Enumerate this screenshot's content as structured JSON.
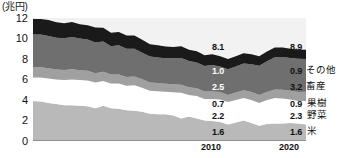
{
  "axis": {
    "unit_label": "(兆円)",
    "y_ticks": [
      "12",
      "10",
      "8",
      "6",
      "4",
      "2",
      "0"
    ],
    "x_labels": [
      "2010",
      "2020"
    ]
  },
  "series_names": {
    "other": "その他",
    "livestock": "畜産",
    "fruit": "果樹",
    "vegetables": "野菜",
    "rice": "米"
  },
  "endpoint_values": {
    "total_2010": "8.1",
    "total_2020": "8.9",
    "other_2010": "1.0",
    "other_2020": "0.9",
    "livestock_2010": "2.5",
    "livestock_2020": "3.2",
    "fruit_2010": "0.7",
    "fruit_2020": "0.9",
    "vegetables_2010": "2.2",
    "vegetables_2020": "2.3",
    "rice_2010": "1.6",
    "rice_2020": "1.6"
  },
  "colors": {
    "other": "#1a1a1a",
    "livestock": "#6f6f6f",
    "fruit": "#a0a0a0",
    "vegetables": "#ffffff",
    "rice": "#b9b9b9",
    "plot_background": "#f2f2f2",
    "axis": "#8d8d8d",
    "text": "#111111"
  },
  "chart_data": {
    "type": "area",
    "title": "",
    "subtitle": "",
    "xlabel": "",
    "ylabel": "(兆円)",
    "ylim": [
      0,
      12
    ],
    "xlim": [
      1985,
      2020
    ],
    "grid": false,
    "stacked": true,
    "legend_position": "right-inline",
    "x": [
      1985,
      1986,
      1987,
      1988,
      1989,
      1990,
      1991,
      1992,
      1993,
      1994,
      1995,
      1996,
      1997,
      1998,
      1999,
      2000,
      2001,
      2002,
      2003,
      2004,
      2005,
      2006,
      2007,
      2008,
      2009,
      2010,
      2011,
      2012,
      2013,
      2014,
      2015,
      2016,
      2017,
      2018,
      2019,
      2020
    ],
    "series": [
      {
        "name": "米",
        "color": "#b9b9b9",
        "values": [
          3.9,
          3.85,
          3.7,
          3.6,
          3.5,
          3.5,
          3.45,
          3.4,
          3.2,
          3.45,
          3.2,
          3.15,
          3.0,
          2.95,
          2.85,
          2.65,
          2.6,
          2.6,
          2.5,
          2.2,
          2.4,
          2.2,
          2.0,
          1.95,
          1.85,
          1.6,
          1.8,
          2.0,
          1.75,
          1.5,
          1.65,
          1.7,
          1.7,
          1.75,
          1.7,
          1.6
        ]
      },
      {
        "name": "野菜",
        "color": "#ffffff",
        "values": [
          2.3,
          2.35,
          2.4,
          2.4,
          2.45,
          2.5,
          2.5,
          2.5,
          2.5,
          2.4,
          2.4,
          2.45,
          2.4,
          2.5,
          2.35,
          2.25,
          2.25,
          2.2,
          2.25,
          2.5,
          2.1,
          2.2,
          2.1,
          2.15,
          2.2,
          2.2,
          2.2,
          2.2,
          2.25,
          2.2,
          2.35,
          2.5,
          2.45,
          2.3,
          2.2,
          2.3
        ]
      },
      {
        "name": "果樹",
        "color": "#a0a0a0",
        "values": [
          1.0,
          1.0,
          1.0,
          0.98,
          0.98,
          1.0,
          0.95,
          0.95,
          0.92,
          0.9,
          0.9,
          0.88,
          0.85,
          0.85,
          0.82,
          0.8,
          0.8,
          0.78,
          0.78,
          0.8,
          0.75,
          0.75,
          0.72,
          0.72,
          0.72,
          0.7,
          0.72,
          0.75,
          0.78,
          0.78,
          0.78,
          0.82,
          0.85,
          0.85,
          0.88,
          0.9
        ]
      },
      {
        "name": "畜産",
        "color": "#6f6f6f",
        "values": [
          3.2,
          3.2,
          3.15,
          3.1,
          3.1,
          3.15,
          3.1,
          3.05,
          3.0,
          2.95,
          2.75,
          2.85,
          2.75,
          2.7,
          2.6,
          2.55,
          2.5,
          2.5,
          2.55,
          2.6,
          2.55,
          2.5,
          2.5,
          2.6,
          2.5,
          2.5,
          2.55,
          2.6,
          2.7,
          2.85,
          3.0,
          3.15,
          3.2,
          3.2,
          3.25,
          3.2
        ]
      },
      {
        "name": "その他",
        "color": "#1a1a1a",
        "values": [
          1.5,
          1.5,
          1.55,
          1.5,
          1.45,
          1.45,
          1.4,
          1.4,
          1.45,
          1.35,
          1.3,
          1.3,
          1.3,
          1.3,
          1.25,
          1.2,
          1.2,
          1.15,
          1.1,
          1.15,
          1.1,
          1.1,
          1.05,
          1.05,
          1.0,
          1.0,
          1.0,
          1.0,
          0.98,
          0.95,
          0.95,
          0.95,
          0.92,
          0.9,
          0.9,
          0.9
        ]
      }
    ],
    "annotations": [
      {
        "text": "8.1",
        "x": 2010,
        "note": "total output 2010"
      },
      {
        "text": "8.9",
        "x": 2020,
        "note": "total output 2020"
      }
    ]
  }
}
